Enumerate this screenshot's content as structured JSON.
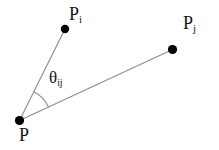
{
  "figure": {
    "type": "geometry-diagram",
    "width": 219,
    "height": 150,
    "background_color": "#ffffff",
    "line_color": "#8c8c8c",
    "point_color": "#000000",
    "text_color": "#141414"
  },
  "points": [
    {
      "id": "P",
      "label_base": "P",
      "label_sub": "",
      "x": 19.5,
      "y": 120.5,
      "radius": 4.6,
      "role": "vertex"
    },
    {
      "id": "Pi",
      "label_base": "P",
      "label_sub": "i",
      "x": 65,
      "y": 29,
      "radius": 4.2,
      "role": "endpoint"
    },
    {
      "id": "Pj",
      "label_base": "P",
      "label_sub": "j",
      "x": 172.5,
      "y": 49.5,
      "radius": 4.6,
      "role": "endpoint"
    }
  ],
  "segments": [
    {
      "id": "P-Pi",
      "from": "P",
      "to": "Pi",
      "x1": 19.5,
      "y1": 120.5,
      "x2": 65,
      "y2": 29,
      "stroke_width": 1.1
    },
    {
      "id": "P-Pj",
      "from": "P",
      "to": "Pj",
      "x1": 19.5,
      "y1": 120.5,
      "x2": 172.5,
      "y2": 49.5,
      "stroke_width": 1.1
    }
  ],
  "angle_marker": {
    "id": "theta-ij",
    "vertex": "P",
    "label_base": "θ",
    "label_sub": "ij",
    "radius": 32,
    "start_deg": -63.6,
    "end_deg": -24.8,
    "stroke_width": 1.1
  }
}
